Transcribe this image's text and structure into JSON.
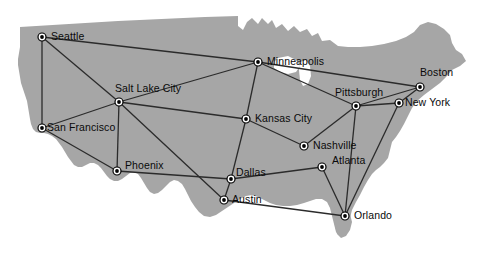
{
  "figure": {
    "kind": "network-map",
    "region_name": "United States",
    "landmass_fill": "#a6a6a6",
    "background": "#ffffff",
    "edge_color": "#2b2b2b",
    "node_fill": "#000000",
    "node_ring": "#ffffff",
    "label_color": "#0a0a0a"
  },
  "nodes": [
    {
      "id": "seattle",
      "label": "Seattle",
      "x": 42,
      "y": 37,
      "label_dx": 9,
      "label_dy": -6
    },
    {
      "id": "salt-lake-city",
      "label": "Salt Lake City",
      "x": 119,
      "y": 102,
      "label_dx": -4,
      "label_dy": -19
    },
    {
      "id": "san-francisco",
      "label": "San Francisco",
      "x": 42,
      "y": 128,
      "label_dx": 5,
      "label_dy": -6
    },
    {
      "id": "phoenix",
      "label": "Phoenix",
      "x": 117,
      "y": 171,
      "label_dx": 8,
      "label_dy": -11
    },
    {
      "id": "minneapolis",
      "label": "Minneapolis",
      "x": 258,
      "y": 62,
      "label_dx": 9,
      "label_dy": -6
    },
    {
      "id": "kansas-city",
      "label": "Kansas City",
      "x": 246,
      "y": 119,
      "label_dx": 9,
      "label_dy": -6
    },
    {
      "id": "dallas",
      "label": "Dallas",
      "x": 231,
      "y": 179,
      "label_dx": 5,
      "label_dy": -12
    },
    {
      "id": "austin",
      "label": "Austin",
      "x": 224,
      "y": 200,
      "label_dx": 8,
      "label_dy": -6
    },
    {
      "id": "nashville",
      "label": "Nashville",
      "x": 304,
      "y": 146,
      "label_dx": 9,
      "label_dy": -6
    },
    {
      "id": "atlanta",
      "label": "Atlanta",
      "x": 322,
      "y": 167,
      "label_dx": 10,
      "label_dy": -12
    },
    {
      "id": "orlando",
      "label": "Orlando",
      "x": 345,
      "y": 216,
      "label_dx": 9,
      "label_dy": -6
    },
    {
      "id": "pittsburgh",
      "label": "Pittsburgh",
      "x": 356,
      "y": 106,
      "label_dx": -21,
      "label_dy": -19
    },
    {
      "id": "new-york",
      "label": "New York",
      "x": 399,
      "y": 103,
      "label_dx": 6,
      "label_dy": -6
    },
    {
      "id": "boston",
      "label": "Boston",
      "x": 420,
      "y": 87,
      "label_dx": 0,
      "label_dy": -20
    }
  ],
  "edges": [
    {
      "from": "seattle",
      "to": "san-francisco"
    },
    {
      "from": "seattle",
      "to": "salt-lake-city"
    },
    {
      "from": "seattle",
      "to": "minneapolis"
    },
    {
      "from": "salt-lake-city",
      "to": "san-francisco"
    },
    {
      "from": "salt-lake-city",
      "to": "minneapolis"
    },
    {
      "from": "salt-lake-city",
      "to": "phoenix"
    },
    {
      "from": "salt-lake-city",
      "to": "kansas-city"
    },
    {
      "from": "salt-lake-city",
      "to": "austin"
    },
    {
      "from": "san-francisco",
      "to": "phoenix"
    },
    {
      "from": "phoenix",
      "to": "dallas"
    },
    {
      "from": "minneapolis",
      "to": "kansas-city"
    },
    {
      "from": "minneapolis",
      "to": "pittsburgh"
    },
    {
      "from": "minneapolis",
      "to": "boston"
    },
    {
      "from": "kansas-city",
      "to": "dallas"
    },
    {
      "from": "kansas-city",
      "to": "nashville"
    },
    {
      "from": "dallas",
      "to": "austin"
    },
    {
      "from": "dallas",
      "to": "atlanta"
    },
    {
      "from": "austin",
      "to": "orlando"
    },
    {
      "from": "nashville",
      "to": "pittsburgh"
    },
    {
      "from": "atlanta",
      "to": "orlando"
    },
    {
      "from": "pittsburgh",
      "to": "orlando"
    },
    {
      "from": "pittsburgh",
      "to": "new-york"
    },
    {
      "from": "pittsburgh",
      "to": "boston"
    },
    {
      "from": "new-york",
      "to": "boston"
    },
    {
      "from": "new-york",
      "to": "orlando"
    }
  ]
}
